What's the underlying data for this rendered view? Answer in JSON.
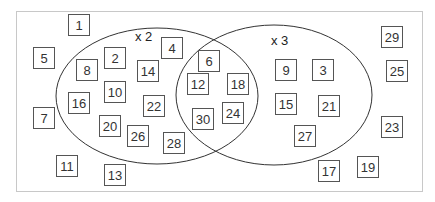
{
  "diagram": {
    "type": "venn",
    "sets": [
      {
        "label": "x 2",
        "members": [
          2,
          4,
          8,
          10,
          14,
          16,
          20,
          22,
          26,
          28
        ]
      },
      {
        "label": "x 3",
        "members": [
          3,
          9,
          15,
          21,
          27
        ]
      }
    ],
    "intersection": [
      6,
      12,
      18,
      24,
      30
    ],
    "outside": [
      1,
      5,
      7,
      11,
      13,
      17,
      19,
      23,
      25,
      29
    ],
    "boxes": [
      {
        "n": "1",
        "x": 68,
        "y": 14
      },
      {
        "n": "5",
        "x": 33,
        "y": 47
      },
      {
        "n": "8",
        "x": 76,
        "y": 59
      },
      {
        "n": "2",
        "x": 104,
        "y": 47
      },
      {
        "n": "4",
        "x": 161,
        "y": 37
      },
      {
        "n": "14",
        "x": 137,
        "y": 60
      },
      {
        "n": "6",
        "x": 198,
        "y": 50
      },
      {
        "n": "12",
        "x": 187,
        "y": 73
      },
      {
        "n": "18",
        "x": 227,
        "y": 73
      },
      {
        "n": "16",
        "x": 68,
        "y": 92
      },
      {
        "n": "10",
        "x": 104,
        "y": 81
      },
      {
        "n": "22",
        "x": 143,
        "y": 95
      },
      {
        "n": "7",
        "x": 33,
        "y": 107
      },
      {
        "n": "20",
        "x": 99,
        "y": 115
      },
      {
        "n": "26",
        "x": 127,
        "y": 125
      },
      {
        "n": "28",
        "x": 163,
        "y": 132
      },
      {
        "n": "30",
        "x": 192,
        "y": 108
      },
      {
        "n": "24",
        "x": 222,
        "y": 102
      },
      {
        "n": "11",
        "x": 56,
        "y": 155
      },
      {
        "n": "13",
        "x": 104,
        "y": 164
      },
      {
        "n": "9",
        "x": 275,
        "y": 59
      },
      {
        "n": "3",
        "x": 312,
        "y": 59
      },
      {
        "n": "15",
        "x": 275,
        "y": 93
      },
      {
        "n": "21",
        "x": 318,
        "y": 95
      },
      {
        "n": "27",
        "x": 294,
        "y": 125
      },
      {
        "n": "17",
        "x": 318,
        "y": 160
      },
      {
        "n": "19",
        "x": 357,
        "y": 156
      },
      {
        "n": "29",
        "x": 381,
        "y": 26
      },
      {
        "n": "25",
        "x": 386,
        "y": 60
      },
      {
        "n": "23",
        "x": 381,
        "y": 116
      }
    ]
  },
  "colors": {
    "frame": "#c8c8c8",
    "stroke": "#333333",
    "box_border": "#555555",
    "text": "#333333"
  }
}
